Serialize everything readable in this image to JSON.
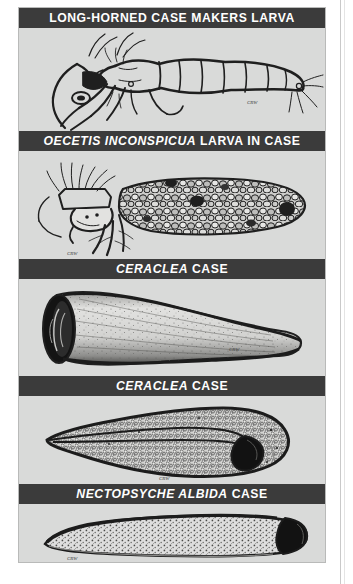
{
  "plate": {
    "background_color": "#d9dad9",
    "caption_bar_color": "#3b3b3b",
    "caption_text_color": "#ffffff",
    "ink_color": "#1c1c1c",
    "figures": [
      {
        "id": "long-horned-case-makers-larva",
        "caption_italic": "",
        "caption_roman": "LONG-HORNED CASE MAKERS LARVA",
        "caption_full": "LONG-HORNED CASE MAKERS LARVA",
        "subject": "caddisfly larva, lateral view, legs and abdominal segments",
        "artist_signature": "CRW"
      },
      {
        "id": "oecetis-inconspicua-larva-in-case",
        "caption_italic": "OECETIS INCONSPICUA",
        "caption_roman": "LARVA IN CASE",
        "caption_full": "OECETIS INCONSPICUA LARVA IN CASE",
        "subject": "larva protruding from pebble/sand-grain case",
        "artist_signature": "CRW"
      },
      {
        "id": "ceraclea-case-tube",
        "caption_italic": "CERACLEA",
        "caption_roman": "CASE",
        "caption_full": "CERACLEA CASE",
        "subject": "tapered conical silk-and-sand tube case, open anterior end",
        "artist_signature": "CRW"
      },
      {
        "id": "ceraclea-case-sponge",
        "caption_italic": "CERACLEA",
        "caption_roman": "CASE",
        "caption_full": "CERACLEA CASE",
        "subject": "broad flattened granular case tapering to a point",
        "artist_signature": "CRW"
      },
      {
        "id": "nectopsyche-albida-case",
        "caption_italic": "NECTOPSYCHE ALBIDA",
        "caption_roman": "CASE",
        "caption_full": "NECTOPSYCHE ALBIDA CASE",
        "subject": "slender curved speckled tube case, dark open end at right",
        "artist_signature": "CRW"
      }
    ]
  }
}
